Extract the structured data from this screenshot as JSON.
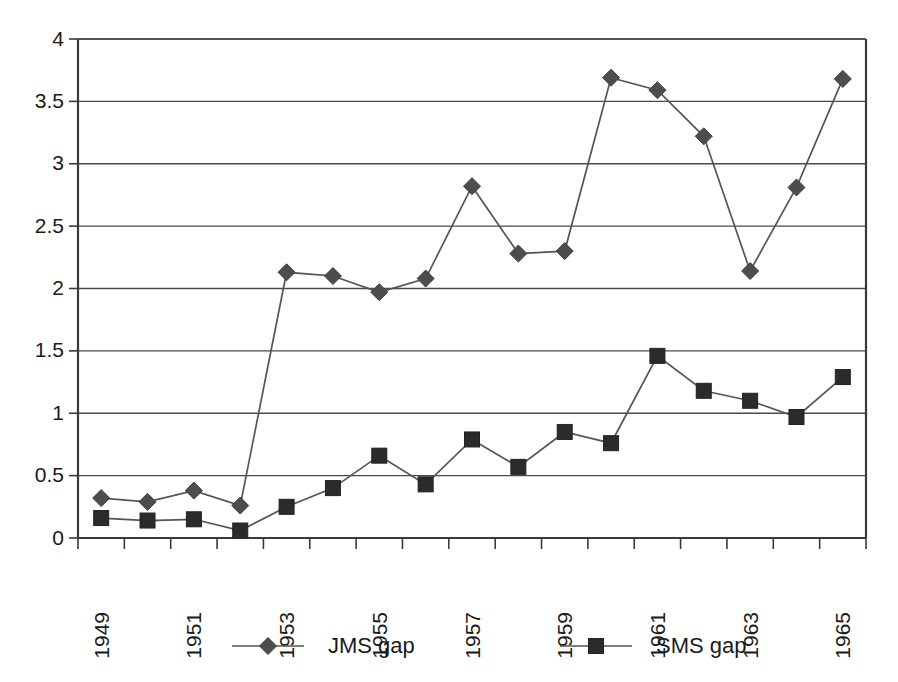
{
  "chart_data": {
    "type": "line",
    "title": "",
    "subtitle": "",
    "xlabel": "",
    "ylabel": "",
    "x": [
      1949,
      1950,
      1951,
      1952,
      1953,
      1954,
      1955,
      1956,
      1957,
      1958,
      1959,
      1960,
      1961,
      1962,
      1963,
      1964,
      1965
    ],
    "categories": [
      "1949",
      "1950",
      "1951",
      "1952",
      "1953",
      "1954",
      "1955",
      "1956",
      "1957",
      "1958",
      "1959",
      "1960",
      "1961",
      "1962",
      "1963",
      "1964",
      "1965"
    ],
    "xtick_labels": [
      "1949",
      "",
      "1951",
      "",
      "1953",
      "",
      "1955",
      "",
      "1957",
      "",
      "1959",
      "",
      "1961",
      "",
      "1963",
      "",
      "1965"
    ],
    "xtick_rotation": -90,
    "ylim": [
      0,
      4
    ],
    "ytick_labels": [
      "0",
      "0.5",
      "1",
      "1.5",
      "2",
      "2.5",
      "3",
      "3.5",
      "4"
    ],
    "ytick_values": [
      0,
      0.5,
      1,
      1.5,
      2,
      2.5,
      3,
      3.5,
      4
    ],
    "grid": "horizontal",
    "legend_position": "bottom",
    "series": [
      {
        "name": "JMS gap",
        "marker": "diamond",
        "color": "#4d4d4d",
        "values": [
          0.32,
          0.29,
          0.38,
          0.26,
          2.13,
          2.1,
          1.97,
          2.08,
          2.82,
          2.28,
          2.3,
          3.69,
          3.59,
          3.22,
          2.14,
          2.81,
          3.68
        ]
      },
      {
        "name": "SMS gap",
        "marker": "square",
        "color": "#2b2b2b",
        "values": [
          0.16,
          0.14,
          0.15,
          0.06,
          0.25,
          0.4,
          0.66,
          0.43,
          0.79,
          0.57,
          0.85,
          0.76,
          1.46,
          1.18,
          1.1,
          0.97,
          1.29
        ]
      }
    ]
  },
  "legend": {
    "items": [
      {
        "label": "JMS gap",
        "marker": "diamond"
      },
      {
        "label": "SMS gap",
        "marker": "square"
      }
    ]
  },
  "colors": {
    "series_jms": "#4d4d4d",
    "series_sms": "#2b2b2b",
    "gridline": "#4a4a4a",
    "axis": "#3a3a3a",
    "background": "#ffffff",
    "text": "#1a1a1a"
  }
}
